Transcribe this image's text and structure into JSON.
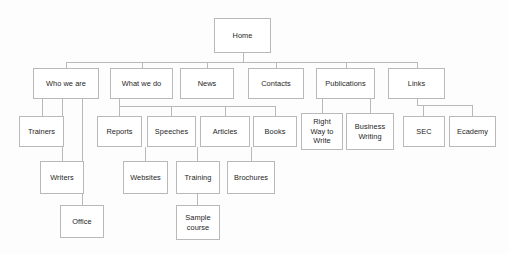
{
  "diagram": {
    "kind": "sitemap-tree",
    "background_color": "#fdfdfd",
    "box_fill_color": "#ffffff",
    "box_border_color": "#b9b9b9",
    "connector_color": "#b9b9b9",
    "text_color": "#1e1e1e"
  },
  "nodes": [
    {
      "id": "home",
      "label": "Home",
      "x": 214,
      "y": 18,
      "w": 57,
      "h": 35,
      "level": 0
    },
    {
      "id": "who-we-are",
      "label": "Who we are",
      "x": 33,
      "y": 68,
      "w": 66,
      "h": 31,
      "level": 1
    },
    {
      "id": "what-we-do",
      "label": "What we do",
      "x": 110,
      "y": 68,
      "w": 63,
      "h": 31,
      "level": 1
    },
    {
      "id": "news",
      "label": "News",
      "x": 180,
      "y": 68,
      "w": 54,
      "h": 31,
      "level": 1
    },
    {
      "id": "contacts",
      "label": "Contacts",
      "x": 248,
      "y": 68,
      "w": 56,
      "h": 31,
      "level": 1
    },
    {
      "id": "publications",
      "label": "Publications",
      "x": 316,
      "y": 68,
      "w": 59,
      "h": 31,
      "level": 1
    },
    {
      "id": "links",
      "label": "Links",
      "x": 388,
      "y": 68,
      "w": 57,
      "h": 31,
      "level": 1
    },
    {
      "id": "trainers",
      "label": "Trainers",
      "x": 19,
      "y": 116,
      "w": 45,
      "h": 31,
      "level": 2
    },
    {
      "id": "reports",
      "label": "Reports",
      "x": 97,
      "y": 116,
      "w": 45,
      "h": 31,
      "level": 2
    },
    {
      "id": "speeches",
      "label": "Speeches",
      "x": 147,
      "y": 116,
      "w": 49,
      "h": 31,
      "level": 2
    },
    {
      "id": "articles",
      "label": "Articles",
      "x": 200,
      "y": 116,
      "w": 50,
      "h": 31,
      "level": 2
    },
    {
      "id": "books",
      "label": "Books",
      "x": 253,
      "y": 116,
      "w": 44,
      "h": 31,
      "level": 2
    },
    {
      "id": "right-way-to-write",
      "label": "Right\nWay to\nWrite",
      "x": 301,
      "y": 113,
      "w": 42,
      "h": 37,
      "level": 2
    },
    {
      "id": "business-writing",
      "label": "Business\nWriting",
      "x": 346,
      "y": 113,
      "w": 48,
      "h": 37,
      "level": 2
    },
    {
      "id": "sec",
      "label": "SEC",
      "x": 403,
      "y": 116,
      "w": 42,
      "h": 31,
      "level": 2
    },
    {
      "id": "ecademy",
      "label": "Ecademy",
      "x": 449,
      "y": 116,
      "w": 47,
      "h": 31,
      "level": 2
    },
    {
      "id": "writers",
      "label": "Writers",
      "x": 40,
      "y": 161,
      "w": 44,
      "h": 33,
      "level": 3
    },
    {
      "id": "websites",
      "label": "Websites",
      "x": 123,
      "y": 161,
      "w": 45,
      "h": 33,
      "level": 3
    },
    {
      "id": "training",
      "label": "Training",
      "x": 176,
      "y": 161,
      "w": 44,
      "h": 33,
      "level": 3
    },
    {
      "id": "brochures",
      "label": "Brochures",
      "x": 227,
      "y": 161,
      "w": 48,
      "h": 33,
      "level": 3
    },
    {
      "id": "office",
      "label": "Office",
      "x": 60,
      "y": 205,
      "w": 44,
      "h": 33,
      "level": 4
    },
    {
      "id": "sample-course",
      "label": "Sample\ncourse",
      "x": 176,
      "y": 205,
      "w": 44,
      "h": 35,
      "level": 4
    }
  ],
  "connectors": {
    "home_stem": {
      "x": 242.5,
      "y1": 53,
      "y2": 62
    },
    "home_bus": {
      "y": 62,
      "x1": 66,
      "x2": 416.5
    },
    "level1_drops": [
      {
        "x": 66,
        "y1": 62,
        "y2": 68
      },
      {
        "x": 141.5,
        "y1": 62,
        "y2": 68
      },
      {
        "x": 207,
        "y1": 62,
        "y2": 68
      },
      {
        "x": 276,
        "y1": 62,
        "y2": 68
      },
      {
        "x": 345.5,
        "y1": 62,
        "y2": 68
      },
      {
        "x": 416.5,
        "y1": 62,
        "y2": 68
      }
    ],
    "who_we_are_drops": [
      {
        "x": 41.5,
        "y1": 99,
        "y2": 116
      },
      {
        "x": 62,
        "y1": 99,
        "y2": 161
      },
      {
        "x": 82,
        "y1": 99,
        "y2": 205
      }
    ],
    "what_we_do_stem": {
      "x": 119,
      "y1": 99,
      "y2": 106
    },
    "what_we_do_bus": {
      "y": 106,
      "x1": 119,
      "x2": 275
    },
    "what_we_do_drops": [
      {
        "x": 119,
        "y1": 106,
        "y2": 116
      },
      {
        "x": 171,
        "y1": 106,
        "y2": 116
      },
      {
        "x": 225,
        "y1": 106,
        "y2": 116
      },
      {
        "x": 275,
        "y1": 106,
        "y2": 116
      }
    ],
    "publications_drops": [
      {
        "x": 322,
        "y1": 99,
        "y2": 113
      },
      {
        "x": 370,
        "y1": 99,
        "y2": 113
      }
    ],
    "links_stem": {
      "x": 416.5,
      "y1": 99,
      "y2": 105
    },
    "links_bus": {
      "y": 105,
      "x1": 416.5,
      "x2": 472
    },
    "links_drops": [
      {
        "x": 423,
        "y1": 105,
        "y2": 116
      },
      {
        "x": 472,
        "y1": 105,
        "y2": 116
      }
    ],
    "level3_drops": [
      {
        "x": 145,
        "y1": 147,
        "y2": 161
      },
      {
        "x": 197,
        "y1": 147,
        "y2": 161
      },
      {
        "x": 251,
        "y1": 147,
        "y2": 161
      }
    ],
    "level4_drops": [
      {
        "x": 197,
        "y1": 194,
        "y2": 205
      }
    ]
  },
  "edges": [
    {
      "from": "home",
      "to": "who-we-are"
    },
    {
      "from": "home",
      "to": "what-we-do"
    },
    {
      "from": "home",
      "to": "news"
    },
    {
      "from": "home",
      "to": "contacts"
    },
    {
      "from": "home",
      "to": "publications"
    },
    {
      "from": "home",
      "to": "links"
    },
    {
      "from": "who-we-are",
      "to": "trainers"
    },
    {
      "from": "who-we-are",
      "to": "writers"
    },
    {
      "from": "who-we-are",
      "to": "office"
    },
    {
      "from": "what-we-do",
      "to": "reports"
    },
    {
      "from": "what-we-do",
      "to": "speeches"
    },
    {
      "from": "what-we-do",
      "to": "articles"
    },
    {
      "from": "what-we-do",
      "to": "books"
    },
    {
      "from": "speeches",
      "to": "websites"
    },
    {
      "from": "articles",
      "to": "training"
    },
    {
      "from": "books",
      "to": "brochures"
    },
    {
      "from": "training",
      "to": "sample-course"
    },
    {
      "from": "publications",
      "to": "right-way-to-write"
    },
    {
      "from": "publications",
      "to": "business-writing"
    },
    {
      "from": "links",
      "to": "sec"
    },
    {
      "from": "links",
      "to": "ecademy"
    }
  ]
}
